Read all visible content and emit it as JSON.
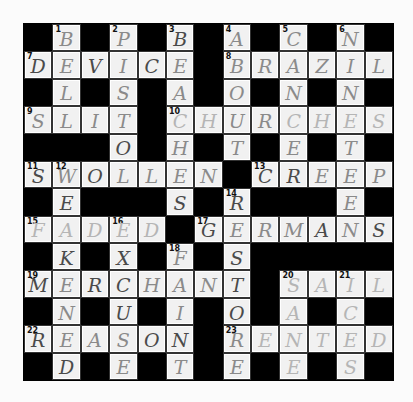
{
  "puzzle": {
    "rows": 13,
    "cols": 13,
    "grid": [
      "#B#P#B#A#C#N#",
      "DEVICE#BRAZIL",
      "#L#S#A#O#N#N#",
      "SLIT#CHURCHES",
      "###O#H#T#E#T#",
      "SWOLLEN#CREEP",
      "#E###S#R###E#",
      "FADED#GERMANS",
      "#K#X#F#S#####",
      "MERCHANT#SAIL",
      "#N#U#I#O#A#C#",
      "REASON#RENTED",
      "#D#E#T#E#E#S#"
    ],
    "numbers": [
      {
        "row": 0,
        "col": 1,
        "n": "1"
      },
      {
        "row": 0,
        "col": 3,
        "n": "2"
      },
      {
        "row": 0,
        "col": 5,
        "n": "3"
      },
      {
        "row": 0,
        "col": 7,
        "n": "4"
      },
      {
        "row": 0,
        "col": 9,
        "n": "5"
      },
      {
        "row": 0,
        "col": 11,
        "n": "6"
      },
      {
        "row": 1,
        "col": 0,
        "n": "7"
      },
      {
        "row": 1,
        "col": 7,
        "n": "8"
      },
      {
        "row": 3,
        "col": 0,
        "n": "9"
      },
      {
        "row": 3,
        "col": 5,
        "n": "10"
      },
      {
        "row": 5,
        "col": 0,
        "n": "11"
      },
      {
        "row": 5,
        "col": 1,
        "n": "12"
      },
      {
        "row": 5,
        "col": 8,
        "n": "13"
      },
      {
        "row": 6,
        "col": 7,
        "n": "14"
      },
      {
        "row": 7,
        "col": 0,
        "n": "15"
      },
      {
        "row": 7,
        "col": 3,
        "n": "16"
      },
      {
        "row": 7,
        "col": 6,
        "n": "17"
      },
      {
        "row": 8,
        "col": 5,
        "n": "18"
      },
      {
        "row": 9,
        "col": 0,
        "n": "19"
      },
      {
        "row": 9,
        "col": 9,
        "n": "20"
      },
      {
        "row": 9,
        "col": 11,
        "n": "21"
      },
      {
        "row": 11,
        "col": 0,
        "n": "22"
      },
      {
        "row": 11,
        "col": 7,
        "n": "23"
      }
    ],
    "dark_cells": [
      "0,5",
      "1,0",
      "1,2",
      "1,4",
      "4,3",
      "5,0",
      "5,2",
      "5,8",
      "5,9",
      "6,1",
      "6,5",
      "6,7",
      "7,6",
      "7,10",
      "7,12",
      "8,1",
      "8,3",
      "8,7",
      "9,0",
      "9,2",
      "9,3",
      "9,7",
      "10,3",
      "10,7",
      "11,0",
      "11,4",
      "11,5",
      "12,1"
    ],
    "faint_cells": [
      "3,5",
      "3,6",
      "3,9",
      "3,10",
      "3,11",
      "3,12",
      "7,0",
      "7,1",
      "7,2",
      "7,3",
      "7,4",
      "9,9",
      "9,10",
      "9,11",
      "9,12",
      "10,9",
      "10,11",
      "11,8",
      "11,9",
      "11,10",
      "11,11",
      "11,12",
      "12,9",
      "12,11"
    ],
    "across": [
      {
        "n": "7",
        "answer": "DEVICE"
      },
      {
        "n": "8",
        "answer": "BRAZIL"
      },
      {
        "n": "9",
        "answer": "SLIT"
      },
      {
        "n": "10",
        "answer": "CHURCHES"
      },
      {
        "n": "11",
        "answer": "SWOLLEN"
      },
      {
        "n": "13",
        "answer": "CREEP"
      },
      {
        "n": "15",
        "answer": "FADED"
      },
      {
        "n": "17",
        "answer": "GERMANS"
      },
      {
        "n": "19",
        "answer": "MERCHANT"
      },
      {
        "n": "20",
        "answer": "SAIL"
      },
      {
        "n": "22",
        "answer": "REASON"
      },
      {
        "n": "23",
        "answer": "RENTED"
      }
    ],
    "down": [
      {
        "n": "1",
        "answer": "BELL"
      },
      {
        "n": "2",
        "answer": "PISTOL"
      },
      {
        "n": "3",
        "answer": "BEACHES"
      },
      {
        "n": "4",
        "answer": "ABOUT"
      },
      {
        "n": "5",
        "answer": "CANCER"
      },
      {
        "n": "6",
        "answer": "NINETEEN"
      },
      {
        "n": "12",
        "answer": "WEAKENED"
      },
      {
        "n": "14",
        "answer": "RESTORE"
      },
      {
        "n": "16",
        "answer": "EXCUSE"
      },
      {
        "n": "18",
        "answer": "FAINT"
      },
      {
        "n": "20",
        "answer": "SANE"
      },
      {
        "n": "21",
        "answer": "ICES"
      }
    ]
  }
}
